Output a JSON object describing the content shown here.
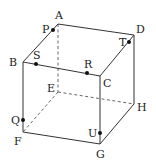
{
  "figure": {
    "type": "cube",
    "vertices": {
      "A": {
        "label": "A",
        "x": 58,
        "y": 24
      },
      "B": {
        "label": "B",
        "x": 23,
        "y": 62
      },
      "C": {
        "label": "C",
        "x": 100,
        "y": 76
      },
      "D": {
        "label": "D",
        "x": 134,
        "y": 35
      },
      "E": {
        "label": "E",
        "x": 58,
        "y": 92
      },
      "F": {
        "label": "F",
        "x": 23,
        "y": 132
      },
      "G": {
        "label": "G",
        "x": 100,
        "y": 144
      },
      "H": {
        "label": "H",
        "x": 134,
        "y": 104
      }
    },
    "points": {
      "P": {
        "label": "P",
        "on_edge": "AB",
        "x": 53,
        "y": 30
      },
      "S": {
        "label": "S",
        "on_edge": "BC",
        "x": 36,
        "y": 64
      },
      "R": {
        "label": "R",
        "on_edge": "BC",
        "x": 87,
        "y": 73
      },
      "T": {
        "label": "T",
        "on_edge": "CD",
        "x": 129,
        "y": 42
      },
      "Q": {
        "label": "Q",
        "on_edge": "BF",
        "x": 23,
        "y": 120
      },
      "U": {
        "label": "U",
        "on_edge": "CG",
        "x": 100,
        "y": 133
      }
    },
    "visible_edges": [
      "AB",
      "AD",
      "BC",
      "CD",
      "BF",
      "CG",
      "DH",
      "FG",
      "GH"
    ],
    "hidden_edges": [
      "AE",
      "EF",
      "EH"
    ]
  }
}
